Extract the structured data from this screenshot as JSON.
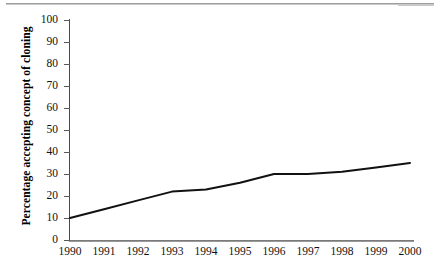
{
  "figure": {
    "scan_rule": "horizontal-rule-artifact"
  },
  "chart_data": {
    "type": "line",
    "title": "",
    "xlabel": "",
    "ylabel": "Percentage accepting concept of cloning",
    "x": [
      1990,
      1991,
      1992,
      1993,
      1994,
      1995,
      1996,
      1997,
      1998,
      1999,
      2000
    ],
    "categories": [
      "1990",
      "1991",
      "1992",
      "1993",
      "1994",
      "1995",
      "1996",
      "1997",
      "1998",
      "1999",
      "2000"
    ],
    "values": [
      10,
      14,
      18,
      22,
      23,
      26,
      30,
      30,
      31,
      33,
      35
    ],
    "series": [
      {
        "name": "Percentage accepting concept of cloning",
        "values": [
          10,
          14,
          18,
          22,
          23,
          26,
          30,
          30,
          31,
          33,
          35
        ]
      }
    ],
    "ylim": [
      0,
      100
    ],
    "yticks": [
      0,
      10,
      20,
      30,
      40,
      50,
      60,
      70,
      80,
      90,
      100
    ],
    "ytick_labels": [
      "0",
      "10",
      "20",
      "30",
      "40",
      "50",
      "60",
      "70",
      "80",
      "90",
      "100"
    ],
    "xtick_labels": [
      "1990",
      "1991",
      "1992",
      "1993",
      "1994",
      "1995",
      "1996",
      "1997",
      "1998",
      "1999",
      "2000"
    ],
    "grid": false,
    "legend": false,
    "line_color": "#111111",
    "background_color": "#ffffff",
    "axis_color": "#4a4a4a"
  }
}
